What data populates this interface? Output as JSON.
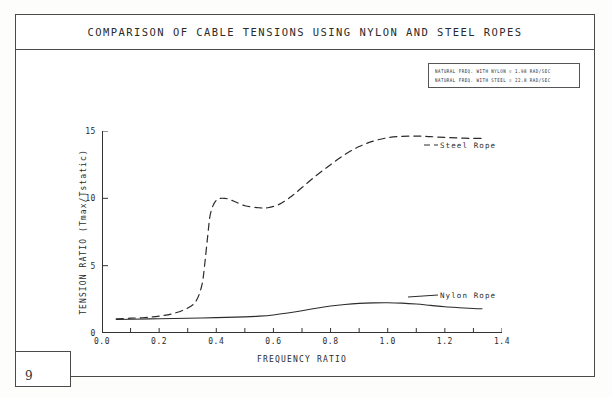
{
  "figure": {
    "title": "COMPARISON OF CABLE TENSIONS USING NYLON AND STEEL ROPES",
    "page_number": "9"
  },
  "note_box": {
    "lines": [
      "NATURAL FREQ. WITH NYLON = 1.98  RAD/SEC",
      "NATURAL FREQ. WITH STEEL = 22.8  RAD/SEC"
    ]
  },
  "annotations": {
    "steel": "Steel Rope",
    "nylon": "Nylon Rope"
  },
  "axis_labels": {
    "x": "FREQUENCY RATIO",
    "y": "TENSION RATIO (Tmax/Tstatic)"
  },
  "chart_data": {
    "type": "line",
    "title": "COMPARISON OF CABLE TENSIONS USING NYLON AND STEEL ROPES",
    "xlabel": "FREQUENCY RATIO",
    "ylabel": "TENSION RATIO (Tmax/Tstatic)",
    "xlim": [
      0.0,
      1.4
    ],
    "ylim": [
      0,
      15
    ],
    "xticks": [
      0.0,
      0.1,
      0.2,
      0.3,
      0.4,
      0.5,
      0.6,
      0.7,
      0.8,
      0.9,
      1.0,
      1.1,
      1.2,
      1.3,
      1.4
    ],
    "xtick_labels": [
      "0.0",
      "",
      "0.2",
      "",
      "0.4",
      "",
      "0.6",
      "",
      "0.8",
      "",
      "1.0",
      "",
      "1.2",
      "",
      "1.4"
    ],
    "yticks": [
      0,
      5,
      10,
      15
    ],
    "ytick_labels": [
      "0",
      "5",
      "10",
      "15"
    ],
    "grid": false,
    "legend_position": "inline-annotation",
    "series": [
      {
        "name": "Steel Rope",
        "style": "dashed",
        "x": [
          0.05,
          0.1,
          0.15,
          0.2,
          0.25,
          0.3,
          0.33,
          0.35,
          0.36,
          0.37,
          0.38,
          0.4,
          0.43,
          0.46,
          0.5,
          0.55,
          0.58,
          0.62,
          0.66,
          0.7,
          0.75,
          0.8,
          0.85,
          0.9,
          0.95,
          1.0,
          1.05,
          1.1,
          1.15,
          1.2,
          1.25,
          1.3,
          1.33
        ],
        "values": [
          1.05,
          1.1,
          1.15,
          1.25,
          1.45,
          1.85,
          2.4,
          3.6,
          5.2,
          7.2,
          8.9,
          9.85,
          10.0,
          9.8,
          9.45,
          9.3,
          9.3,
          9.55,
          10.1,
          10.8,
          11.7,
          12.5,
          13.25,
          13.85,
          14.25,
          14.5,
          14.6,
          14.62,
          14.58,
          14.52,
          14.48,
          14.45,
          14.45
        ]
      },
      {
        "name": "Nylon Rope",
        "style": "solid",
        "x": [
          0.05,
          0.1,
          0.2,
          0.3,
          0.4,
          0.5,
          0.55,
          0.6,
          0.65,
          0.7,
          0.75,
          0.8,
          0.85,
          0.9,
          0.95,
          1.0,
          1.05,
          1.1,
          1.15,
          1.2,
          1.25,
          1.3,
          1.33
        ],
        "values": [
          1.0,
          1.02,
          1.06,
          1.1,
          1.14,
          1.2,
          1.25,
          1.34,
          1.48,
          1.65,
          1.84,
          2.0,
          2.12,
          2.2,
          2.24,
          2.25,
          2.22,
          2.15,
          2.05,
          1.95,
          1.88,
          1.82,
          1.8
        ]
      }
    ]
  }
}
